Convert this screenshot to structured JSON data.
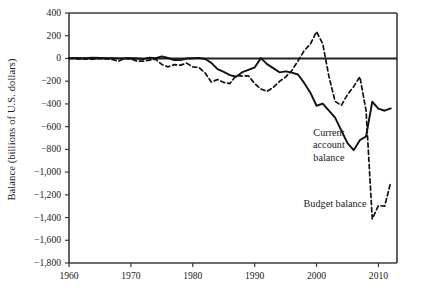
{
  "chart_data": {
    "type": "line",
    "title": "",
    "xlabel": "",
    "ylabel": "Balance (billions of U.S. dollars)",
    "xlim": [
      1960,
      2013
    ],
    "ylim": [
      -1800,
      400
    ],
    "grid": false,
    "legend_position": "inline-annotations",
    "xticks": [
      1960,
      1970,
      1980,
      1990,
      2000,
      2010
    ],
    "xtick_labels": [
      "1960",
      "1970",
      "1980",
      "1990",
      "2000",
      "2010"
    ],
    "yticks": [
      400,
      200,
      0,
      -200,
      -400,
      -600,
      -800,
      -1000,
      -1200,
      -1400,
      -1600,
      -1800
    ],
    "ytick_labels": [
      "400",
      "200",
      "0",
      "−200",
      "−400",
      "−600",
      "−800",
      "−1,000",
      "−1,200",
      "−1,400",
      "−1,600",
      "−1,800"
    ],
    "zero_line": 0,
    "series": [
      {
        "name": "Current account balance",
        "style": "solid",
        "color": "#111111",
        "x": [
          1960,
          1961,
          1962,
          1963,
          1964,
          1965,
          1966,
          1967,
          1968,
          1969,
          1970,
          1971,
          1972,
          1973,
          1974,
          1975,
          1976,
          1977,
          1978,
          1979,
          1980,
          1981,
          1982,
          1983,
          1984,
          1985,
          1986,
          1987,
          1988,
          1989,
          1990,
          1991,
          1992,
          1993,
          1994,
          1995,
          1996,
          1997,
          1998,
          1999,
          2000,
          2001,
          2002,
          2003,
          2004,
          2005,
          2006,
          2007,
          2008,
          2009,
          2010,
          2011,
          2012
        ],
        "values": [
          3,
          4,
          3,
          4,
          7,
          5,
          3,
          3,
          1,
          0,
          2,
          -1,
          -6,
          7,
          2,
          18,
          4,
          -14,
          -15,
          -1,
          2,
          5,
          -5,
          -39,
          -94,
          -118,
          -147,
          -161,
          -121,
          -100,
          -79,
          3,
          -50,
          -85,
          -122,
          -114,
          -125,
          -141,
          -215,
          -301,
          -416,
          -397,
          -459,
          -521,
          -634,
          -745,
          -807,
          -719,
          -687,
          -381,
          -442,
          -460,
          -440
        ]
      },
      {
        "name": "Budget balance",
        "style": "dashed",
        "color": "#111111",
        "x": [
          1960,
          1961,
          1962,
          1963,
          1964,
          1965,
          1966,
          1967,
          1968,
          1969,
          1970,
          1971,
          1972,
          1973,
          1974,
          1975,
          1976,
          1977,
          1978,
          1979,
          1980,
          1981,
          1982,
          1983,
          1984,
          1985,
          1986,
          1987,
          1988,
          1989,
          1990,
          1991,
          1992,
          1993,
          1994,
          1995,
          1996,
          1997,
          1998,
          1999,
          2000,
          2001,
          2002,
          2003,
          2004,
          2005,
          2006,
          2007,
          2008,
          2009,
          2010,
          2011,
          2012
        ],
        "values": [
          0,
          -3,
          -7,
          -5,
          -6,
          -1,
          -4,
          -9,
          -25,
          3,
          -3,
          -23,
          -23,
          -15,
          -6,
          -53,
          -74,
          -54,
          -59,
          -41,
          -74,
          -79,
          -128,
          -208,
          -185,
          -212,
          -221,
          -150,
          -155,
          -153,
          -221,
          -269,
          -290,
          -255,
          -203,
          -164,
          -107,
          -22,
          69,
          126,
          236,
          128,
          -158,
          -378,
          -413,
          -318,
          -248,
          -161,
          -459,
          -1413,
          -1294,
          -1300,
          -1087
        ]
      }
    ],
    "annotations": [
      {
        "text_lines": [
          "Current",
          "account",
          "balance"
        ],
        "x": 2002,
        "y": -600
      },
      {
        "text_lines": [
          "Budget balance"
        ],
        "x": 2003,
        "y": -1230
      }
    ]
  },
  "axis": {
    "y_title": "Balance (billions of U.S. dollars)"
  }
}
